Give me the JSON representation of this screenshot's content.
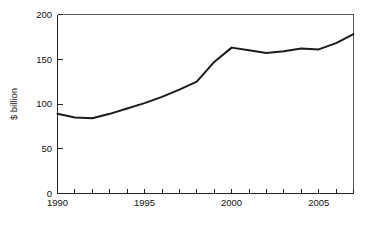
{
  "chart_data": {
    "type": "line",
    "title": "",
    "subtitle": "",
    "xlabel": "",
    "ylabel": "$ billion",
    "xlim": [
      1990,
      2007
    ],
    "ylim": [
      0,
      200
    ],
    "grid": false,
    "legend": "none",
    "x_tick_labels": [
      "1990",
      "1995",
      "2000",
      "2005"
    ],
    "x_tick_values": [
      1990,
      1995,
      2000,
      2005
    ],
    "x_minor_tick_values": [
      1990,
      1991,
      1992,
      1993,
      1994,
      1995,
      1996,
      1997,
      1998,
      1999,
      2000,
      2001,
      2002,
      2003,
      2004,
      2005,
      2006,
      2007
    ],
    "y_tick_labels": [
      "0",
      "50",
      "100",
      "150",
      "200"
    ],
    "y_tick_values": [
      0,
      50,
      100,
      150,
      200
    ],
    "x": [
      1990,
      1991,
      1992,
      1993,
      1994,
      1995,
      1996,
      1997,
      1998,
      1999,
      2000,
      2001,
      2002,
      2003,
      2004,
      2005,
      2006,
      2007
    ],
    "values": [
      89,
      85,
      84,
      89,
      95,
      101,
      108,
      116,
      125,
      147,
      163,
      160,
      157,
      159,
      162,
      161,
      168,
      178
    ],
    "series": [
      {
        "name": "$ billion",
        "color": "#1c1c1c",
        "values": [
          89,
          85,
          84,
          89,
          95,
          101,
          108,
          116,
          125,
          147,
          163,
          160,
          157,
          159,
          162,
          161,
          168,
          178
        ]
      }
    ],
    "annotations": [],
    "colors": {
      "line": "#1c1c1c",
      "axis": "#222222",
      "frame": "#555555",
      "text": "#111111",
      "background": "#ffffff"
    }
  }
}
